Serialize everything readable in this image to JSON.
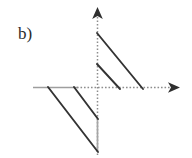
{
  "figure": {
    "panel_label": "b)",
    "width": 192,
    "height": 158,
    "background_color": "#ffffff",
    "axis_color": "#9a9a9a",
    "axis_solid_color": "#9e9e9e",
    "curve_color": "#333333",
    "label_color": "#2b2b2b"
  },
  "chart_data": {
    "type": "line",
    "title": "b)",
    "subtitle": "",
    "xlabel": "",
    "ylabel": "",
    "grid": false,
    "legend_position": "none",
    "axis_style": "dotted-with-arrowheads",
    "origin": {
      "x": 97,
      "y": 87
    },
    "xlim": [
      -64,
      83
    ],
    "ylim": [
      -68,
      80
    ],
    "axes": [
      {
        "name": "x-axis",
        "orientation": "horizontal",
        "from": {
          "x": 33,
          "y": 87
        },
        "to": {
          "x": 180,
          "y": 87
        },
        "arrow_at": "to",
        "solid_from": {
          "x": 33,
          "y": 87
        },
        "solid_to": {
          "x": 78,
          "y": 87
        },
        "style": "dotted"
      },
      {
        "name": "y-axis",
        "orientation": "vertical",
        "from": {
          "x": 97,
          "y": 155
        },
        "to": {
          "x": 97,
          "y": 7
        },
        "arrow_at": "to",
        "solid_from": {
          "x": 97,
          "y": 119
        },
        "solid_to": {
          "x": 97,
          "y": 152
        },
        "style": "dotted"
      }
    ],
    "series": [
      {
        "name": "upper-branch-long",
        "quadrant": "upper-right",
        "from": {
          "x": 97,
          "y": 33
        },
        "to": {
          "x": 143,
          "y": 89
        },
        "slope": -1.22
      },
      {
        "name": "upper-branch-short",
        "quadrant": "upper-right",
        "from": {
          "x": 97,
          "y": 64
        },
        "to": {
          "x": 120,
          "y": 89
        },
        "slope": -1.09
      },
      {
        "name": "lower-branch-long",
        "quadrant": "lower-left",
        "from": {
          "x": 48,
          "y": 87
        },
        "to": {
          "x": 98,
          "y": 152
        },
        "slope": -1.3
      },
      {
        "name": "lower-branch-short",
        "quadrant": "lower-left",
        "from": {
          "x": 74,
          "y": 87
        },
        "to": {
          "x": 98,
          "y": 119
        },
        "slope": -1.33
      }
    ],
    "annotations": [
      {
        "text": "b)",
        "x": 18,
        "y": 36
      }
    ]
  }
}
